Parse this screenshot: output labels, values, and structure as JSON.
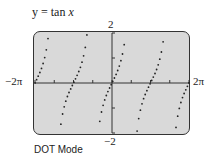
{
  "title": {
    "prefix": "y = tan ",
    "var": "x"
  },
  "mode_label": "DOT Mode",
  "chart_data": {
    "type": "scatter",
    "title": "y = tan x",
    "subtitle": "DOT Mode",
    "xlabel": "x",
    "ylabel": "y",
    "xlim": [
      "-2π",
      "2π"
    ],
    "ylim": [
      -2,
      2
    ],
    "tick_labels": {
      "x_min": "−2π",
      "x_max": "2π",
      "y_max": "2",
      "y_min": "−2"
    },
    "x_ticks_interval": "π/2",
    "y_ticks": [
      -1,
      1
    ],
    "grid": false,
    "series": [
      {
        "name": "tan x",
        "function": "tan(x)",
        "style": "dots",
        "domain": "[-2π, 2π]"
      }
    ],
    "asymptotes": [
      "-3π/2",
      "-π/2",
      "π/2",
      "3π/2"
    ]
  },
  "colors": {
    "screen_bg": "#d9d9d9",
    "frame": "#333333",
    "dots": "#222222"
  }
}
